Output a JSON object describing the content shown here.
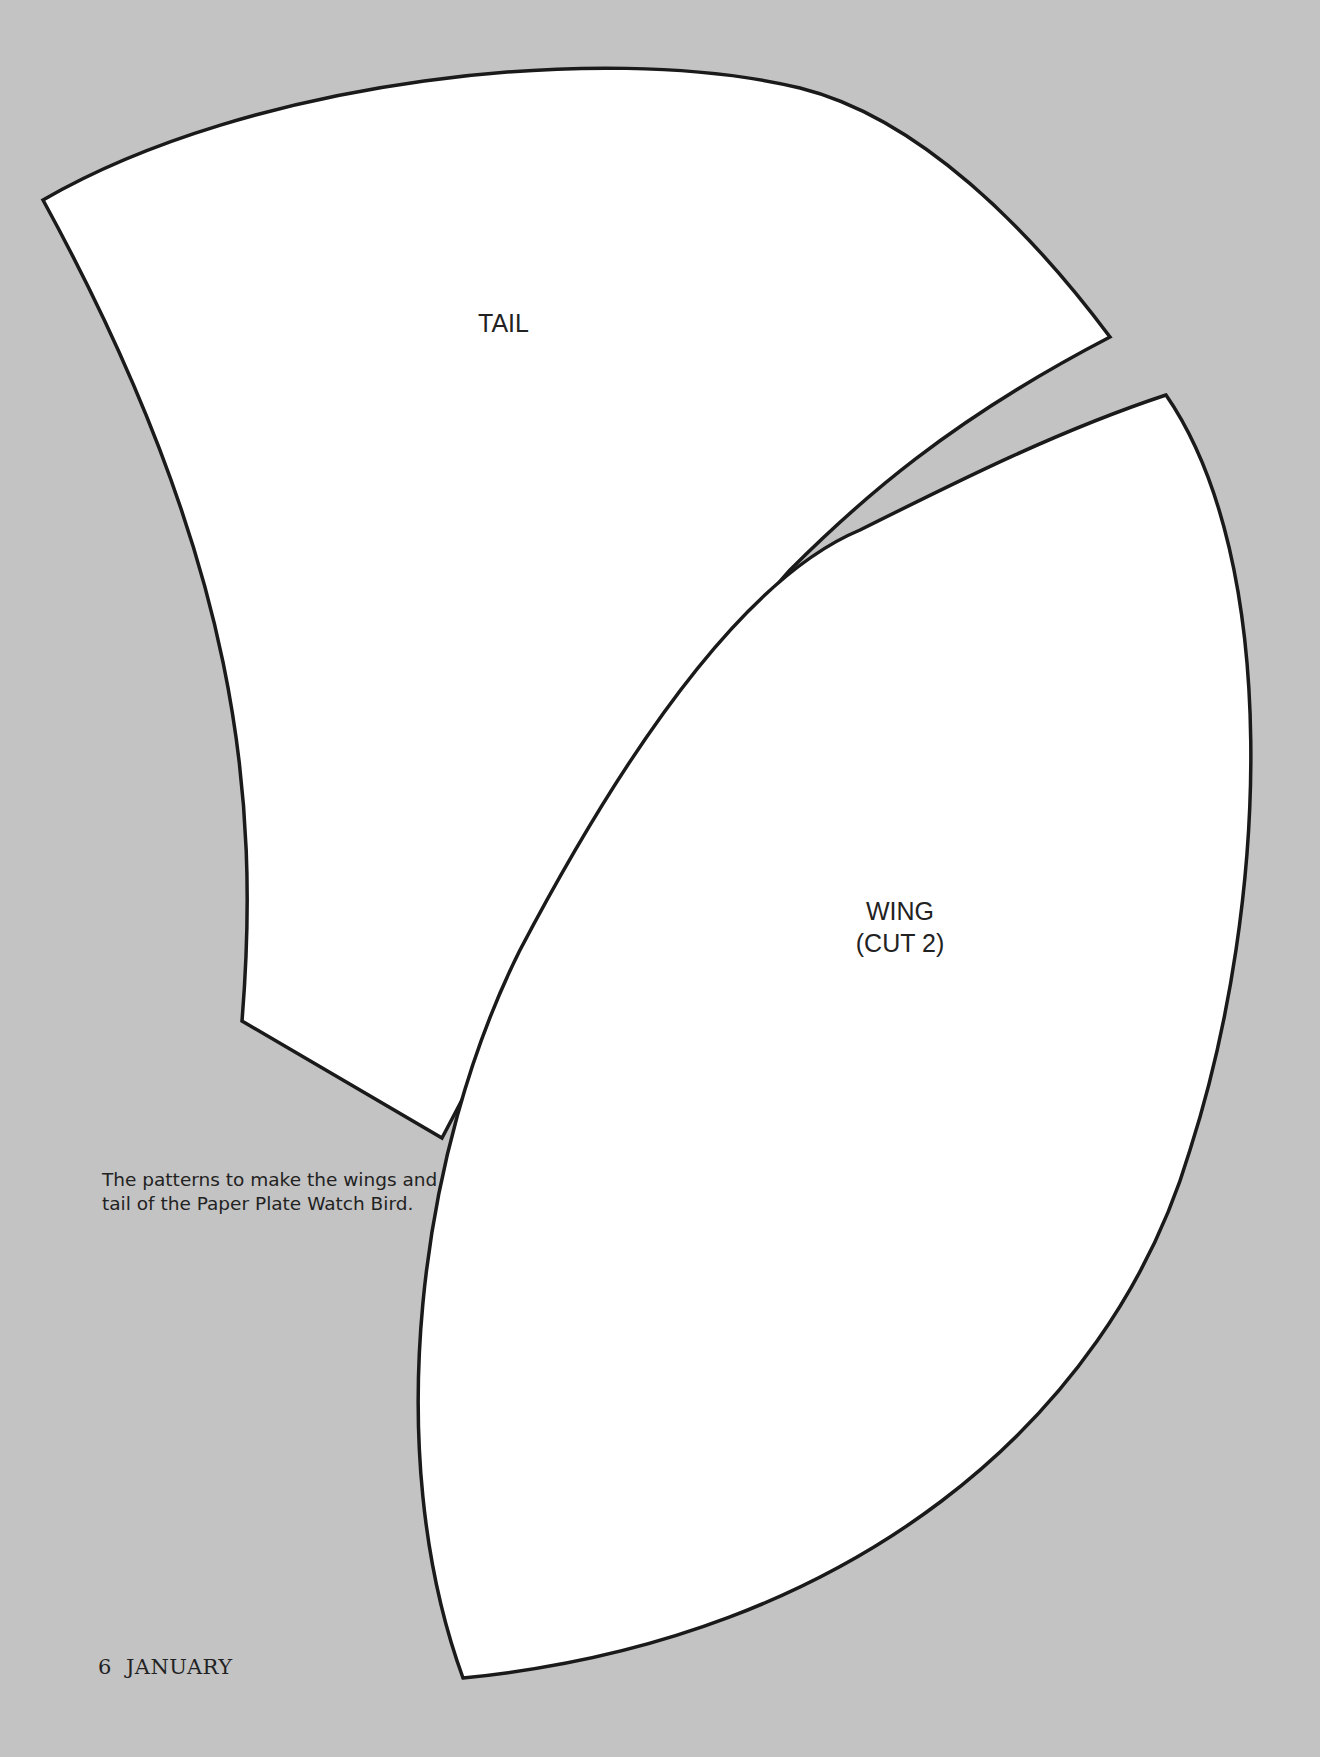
{
  "pieces": {
    "tail": {
      "label": "TAIL"
    },
    "wing": {
      "label_line1": "WING",
      "label_line2": "(CUT 2)"
    }
  },
  "caption": "The patterns to make the wings and tail of the Paper Plate Watch Bird.",
  "folio": {
    "page_number": "6",
    "section": "JANUARY"
  },
  "colors": {
    "background": "#c3c3c3",
    "piece_fill": "#ffffff",
    "outline": "#1a1a1a",
    "text": "#222222"
  }
}
